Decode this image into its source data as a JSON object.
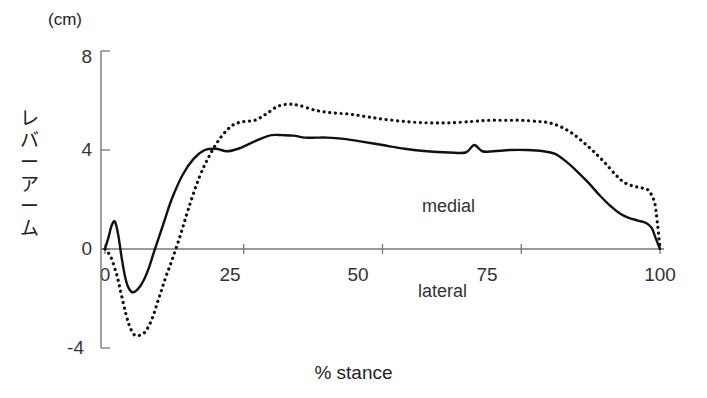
{
  "chart_data": {
    "type": "line",
    "title": "",
    "xlabel": "% stance",
    "ylabel": "レバーアーム",
    "unit_label": "(cm)",
    "xlim": [
      0,
      100
    ],
    "ylim": [
      -4,
      8
    ],
    "grid": false,
    "legend": "none",
    "x_ticks": [
      "0",
      "25",
      "50",
      "75",
      "100"
    ],
    "x_tick_values": [
      0,
      25,
      50,
      75,
      100
    ],
    "y_ticks": [
      "8",
      "4",
      "0",
      "-4"
    ],
    "y_tick_values": [
      8,
      4,
      0,
      -4
    ],
    "annotations": [
      {
        "text": "medial",
        "x": 62,
        "y": 2.1
      },
      {
        "text": "lateral",
        "x": 57,
        "y": -1.3
      }
    ],
    "series": [
      {
        "name": "solid-curve",
        "style": "solid",
        "color": "#111111",
        "x": [
          0,
          0.6,
          1.2,
          1.8,
          2.4,
          3.0,
          3.6,
          4.2,
          5.0,
          6.0,
          7.0,
          8.0,
          9.0,
          10.5,
          12,
          14,
          16,
          18,
          20,
          22,
          24,
          26,
          28,
          30,
          32,
          34,
          36,
          38,
          40,
          43,
          46,
          50,
          54,
          58,
          62,
          65,
          66.5,
          68,
          70,
          73,
          76,
          79,
          81,
          83,
          85,
          87,
          89,
          91,
          93,
          94.5,
          96,
          97.5,
          98.5,
          99.2,
          100
        ],
        "y": [
          0,
          0.45,
          0.95,
          1.1,
          0.55,
          -0.35,
          -1.1,
          -1.55,
          -1.75,
          -1.6,
          -1.25,
          -0.7,
          0.0,
          1.0,
          2.0,
          3.0,
          3.65,
          4.0,
          4.05,
          3.95,
          4.05,
          4.25,
          4.45,
          4.6,
          4.6,
          4.58,
          4.5,
          4.5,
          4.5,
          4.45,
          4.35,
          4.2,
          4.05,
          3.95,
          3.9,
          3.9,
          4.2,
          3.95,
          3.95,
          4.0,
          4.0,
          3.95,
          3.85,
          3.55,
          3.15,
          2.7,
          2.2,
          1.75,
          1.4,
          1.25,
          1.15,
          1.05,
          0.85,
          0.45,
          0.0
        ]
      },
      {
        "name": "dotted-curve",
        "style": "dotted",
        "color": "#111111",
        "x": [
          0,
          1.0,
          2.0,
          2.6,
          3.2,
          3.8,
          4.4,
          5.2,
          6.0,
          7.0,
          7.8,
          8.6,
          9.4,
          10.2,
          11.0,
          12,
          13.5,
          15,
          17,
          19,
          21,
          23,
          25,
          27,
          29,
          31,
          33,
          35,
          38,
          41,
          44,
          47,
          50,
          54,
          58,
          62,
          66,
          69,
          72,
          75,
          78,
          80,
          82,
          84,
          86,
          88,
          90,
          92,
          93.5,
          95,
          96,
          97,
          98,
          99,
          99.5,
          100
        ],
        "y": [
          0,
          -0.3,
          -0.95,
          -1.5,
          -2.1,
          -2.65,
          -3.1,
          -3.45,
          -3.5,
          -3.4,
          -3.15,
          -2.75,
          -2.2,
          -1.65,
          -1.1,
          -0.5,
          0.5,
          1.6,
          2.9,
          3.85,
          4.55,
          5.0,
          5.15,
          5.2,
          5.45,
          5.75,
          5.85,
          5.8,
          5.6,
          5.5,
          5.45,
          5.35,
          5.25,
          5.15,
          5.1,
          5.1,
          5.15,
          5.2,
          5.2,
          5.2,
          5.15,
          5.1,
          4.95,
          4.7,
          4.35,
          3.95,
          3.5,
          3.0,
          2.7,
          2.55,
          2.5,
          2.45,
          2.35,
          1.9,
          1.1,
          0.0
        ]
      }
    ]
  },
  "axes": {
    "y_axis_name": "lever-arm-axis",
    "x_axis_name": "percent-stance-axis"
  }
}
